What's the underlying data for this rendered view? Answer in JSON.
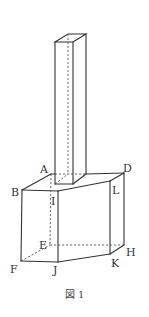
{
  "figure": {
    "caption": "図 1",
    "labels": {
      "A": "A",
      "B": "B",
      "D": "D",
      "E": "E",
      "F": "F",
      "H": "H",
      "I": "I",
      "J": "J",
      "K": "K",
      "L": "L"
    },
    "colors": {
      "line": "#333333",
      "background": "#ffffff"
    }
  }
}
